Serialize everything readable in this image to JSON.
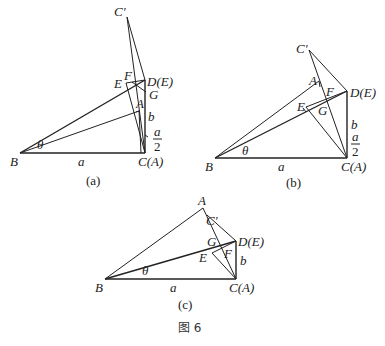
{
  "figure": {
    "caption": "图 6",
    "panels": [
      {
        "id": "a",
        "caption": "(a)",
        "labels": {
          "B": "B",
          "C": "C(A)",
          "D": "D(E)",
          "Cp": "C′",
          "E": "E",
          "F": "F",
          "G": "G",
          "A": "A",
          "a": "a",
          "b": "b",
          "theta": "θ",
          "half_num": "a",
          "half_den": "2"
        }
      },
      {
        "id": "b",
        "caption": "(b)",
        "labels": {
          "B": "B",
          "C": "C(A)",
          "D": "D(E)",
          "Cp": "C′",
          "E": "E",
          "F": "F",
          "G": "G",
          "A": "A",
          "a": "a",
          "b": "b",
          "theta": "θ",
          "half_num": "a",
          "half_den": "2"
        }
      },
      {
        "id": "c",
        "caption": "(c)",
        "labels": {
          "B": "B",
          "C": "C(A)",
          "D": "D(E)",
          "Cp": "C′",
          "E": "E",
          "F": "F",
          "G": "G",
          "A": "A",
          "a": "a",
          "b": "b",
          "theta": "θ"
        }
      }
    ]
  }
}
